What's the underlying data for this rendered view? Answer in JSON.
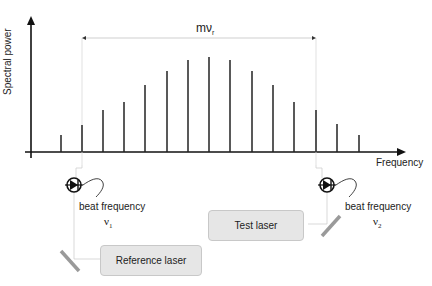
{
  "diagram": {
    "y_axis_label": "Spectral power",
    "x_axis_label": "Frequency",
    "span_label": {
      "base": "mν",
      "subscript": "r"
    },
    "left_detector": {
      "label": "beat frequency",
      "symbol": "ν",
      "subscript": "1"
    },
    "right_detector": {
      "label": "beat frequency",
      "symbol": "ν",
      "subscript": "2"
    },
    "reference_laser": {
      "label": "Reference laser"
    },
    "test_laser": {
      "label": "Test laser"
    },
    "comb_lines": {
      "x": [
        61,
        82,
        103,
        124,
        145,
        167,
        188,
        209,
        230,
        252,
        273,
        294,
        316,
        337,
        359
      ],
      "top_y": [
        135,
        125,
        110,
        102,
        85,
        71,
        60,
        57,
        60,
        71,
        85,
        102,
        110,
        124,
        135
      ],
      "baseline_y": 152
    },
    "colors": {
      "axis": "#111111",
      "comb": "#222222",
      "beam": "#cfcfcf",
      "mirror": "#9a9a9a",
      "box_fill": "#e6e6e6",
      "box_border": "#c8c8c8"
    }
  }
}
